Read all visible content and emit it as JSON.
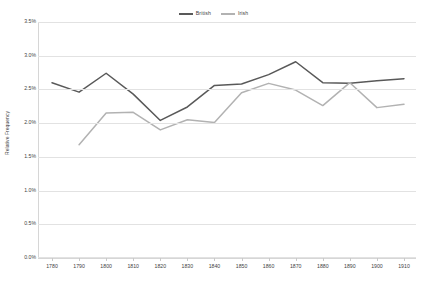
{
  "chart_data": {
    "type": "line",
    "title": "",
    "xlabel": "",
    "ylabel": "Relative Frequency",
    "categories": [
      1780,
      1790,
      1800,
      1810,
      1820,
      1830,
      1840,
      1850,
      1860,
      1870,
      1880,
      1890,
      1900,
      1910
    ],
    "x": [
      1780,
      1790,
      1800,
      1810,
      1820,
      1830,
      1840,
      1850,
      1860,
      1870,
      1880,
      1890,
      1900,
      1910
    ],
    "xlim": [
      1780,
      1910
    ],
    "ylim": [
      0.0,
      3.5
    ],
    "y_tick_labels": [
      "0.0%",
      "0.5%",
      "1.0%",
      "1.5%",
      "2.0%",
      "2.5%",
      "3.0%",
      "3.5%"
    ],
    "y_tick_values": [
      0.0,
      0.5,
      1.0,
      1.5,
      2.0,
      2.5,
      3.0,
      3.5
    ],
    "x_tick_labels": [
      "1780",
      "1790",
      "1800",
      "1810",
      "1820",
      "1830",
      "1840",
      "1850",
      "1860",
      "1870",
      "1880",
      "1890",
      "1900",
      "1910"
    ],
    "grid": true,
    "legend_position": "top-center",
    "series": [
      {
        "name": "British",
        "color": "#595959",
        "values": [
          2.6,
          2.46,
          2.74,
          2.43,
          2.04,
          2.24,
          2.56,
          2.58,
          2.72,
          2.91,
          2.6,
          2.59,
          2.63,
          2.66
        ]
      },
      {
        "name": "Irish",
        "color": "#b2b2b2",
        "values": [
          null,
          1.68,
          2.15,
          2.16,
          1.9,
          2.05,
          2.01,
          2.45,
          2.59,
          2.49,
          2.26,
          2.6,
          2.23,
          2.28
        ]
      }
    ]
  },
  "legend": {
    "entries": [
      {
        "label": "British",
        "color": "#595959"
      },
      {
        "label": "Irish",
        "color": "#b2b2b2"
      }
    ]
  },
  "axes": {
    "y_title": "Relative Frequency"
  }
}
